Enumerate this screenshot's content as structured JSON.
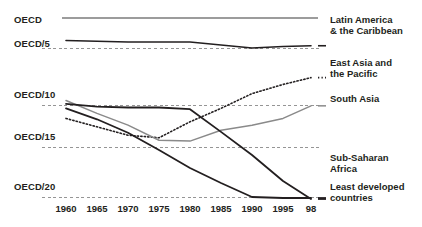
{
  "chart_data": {
    "type": "line",
    "title": "",
    "subtitle": "",
    "xlabel": "",
    "ylabel": "",
    "grid": true,
    "legend_position": "right-inline",
    "x": [
      1960,
      1965,
      1970,
      1975,
      1980,
      1985,
      1990,
      1995,
      1998
    ],
    "x_tick_labels": [
      "1960",
      "1965",
      "1970",
      "1975",
      "1980",
      "1985",
      "1990",
      "1995",
      "98"
    ],
    "y_tick_labels": [
      "OECD",
      "OECD/5",
      "OECD/10",
      "OECD/15",
      "OECD/20"
    ],
    "y_tick_values": [
      1,
      5,
      10,
      15,
      20
    ],
    "y_axis_note": "Income relative to OECD: axis labelled as fractions OECD, OECD/5, OECD/10, OECD/15, OECD/20 (value = OECD divided by n)",
    "ylim": [
      1,
      21
    ],
    "reference_line": {
      "name": "OECD",
      "value": 1,
      "style": "solid"
    },
    "series": [
      {
        "name": "Latin America & the Caribbean",
        "style": "solid",
        "color": "#231f20",
        "width": 1.6,
        "values": [
          4.0,
          4.1,
          4.2,
          4.2,
          4.2,
          4.6,
          5.0,
          4.8,
          4.7
        ]
      },
      {
        "name": "East Asia and the Pacific",
        "style": "dotted",
        "color": "#231f20",
        "width": 1.6,
        "values": [
          11.6,
          12.6,
          13.6,
          13.9,
          12.0,
          10.4,
          9.0,
          8.2,
          7.6
        ]
      },
      {
        "name": "South Asia",
        "style": "solid",
        "color": "#8a8a8a",
        "width": 1.5,
        "values": [
          9.6,
          11.0,
          12.4,
          14.2,
          14.3,
          13.0,
          12.4,
          11.6,
          10.1
        ]
      },
      {
        "name": "Sub-Saharan Africa",
        "style": "solid",
        "color": "#231f20",
        "width": 1.8,
        "values": [
          9.9,
          10.2,
          10.3,
          10.3,
          10.5,
          13.2,
          15.8,
          18.4,
          20.2
        ]
      },
      {
        "name": "Least developed countries",
        "style": "solid",
        "color": "#231f20",
        "width": 1.8,
        "values": [
          10.4,
          11.7,
          13.3,
          15.3,
          17.1,
          18.6,
          20.0,
          20.1,
          20.1
        ]
      }
    ]
  },
  "axis": {
    "y_ticks": [
      {
        "label": "OECD",
        "top": 14,
        "gridline": false
      },
      {
        "label": "OECD/5",
        "top": 38,
        "gridline": true
      },
      {
        "label": "OECD/10",
        "top": 89,
        "gridline": true
      },
      {
        "label": "OECD/15",
        "top": 131,
        "gridline": true
      },
      {
        "label": "OECD/20",
        "top": 181,
        "gridline": true
      }
    ],
    "x_ticks": [
      {
        "label": "1960",
        "left": 66
      },
      {
        "label": "1965",
        "left": 97
      },
      {
        "label": "1970",
        "left": 128
      },
      {
        "label": "1975",
        "left": 159
      },
      {
        "label": "1980",
        "left": 190
      },
      {
        "label": "1985",
        "left": 221
      },
      {
        "label": "1990",
        "left": 252
      },
      {
        "label": "1995",
        "left": 283
      },
      {
        "label": "98",
        "left": 311
      }
    ]
  },
  "series_labels": [
    {
      "lines": [
        "Latin America",
        "& the Caribbean"
      ],
      "left": 330,
      "top": 14
    },
    {
      "lines": [
        "East Asia and",
        "the Pacific"
      ],
      "left": 330,
      "top": 57
    },
    {
      "lines": [
        "South Asia"
      ],
      "left": 330,
      "top": 93
    },
    {
      "lines": [
        "Sub-Saharan",
        "Africa"
      ],
      "left": 330,
      "top": 152
    },
    {
      "lines": [
        "Least developed",
        "countries"
      ],
      "left": 330,
      "top": 181
    }
  ]
}
